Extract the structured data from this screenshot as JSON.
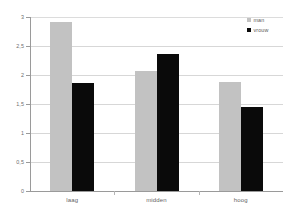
{
  "chart_data": {
    "type": "bar",
    "title": "",
    "subtitle": "",
    "xlabel": "",
    "ylabel": "",
    "categories": [
      "laag",
      "midden",
      "hoog"
    ],
    "series": [
      {
        "name": "man",
        "color": "#c2c2c2",
        "values": [
          2.91,
          2.07,
          1.88
        ]
      },
      {
        "name": "vrouw",
        "color": "#0a0a0a",
        "values": [
          1.86,
          2.36,
          1.45
        ]
      }
    ],
    "ylim": [
      0,
      3
    ],
    "ytick_values": [
      0,
      0.5,
      1,
      1.5,
      2,
      2.5,
      3
    ],
    "ytick_labels": [
      "0",
      "0,5",
      "1",
      "1,5",
      "2",
      "2,5",
      "3"
    ],
    "grid": true,
    "grid_axis": "y",
    "legend_position": "top-right",
    "annotations": []
  },
  "legend": {
    "entries": [
      {
        "label": "man",
        "swatch": "legend-swatch-man"
      },
      {
        "label": "vrouw",
        "swatch": "legend-swatch-vrouw"
      }
    ]
  },
  "colors": {
    "series_man": "#c2c2c2",
    "series_vrouw": "#0a0a0a",
    "gridline": "#d7d7d7",
    "axis": "#9a9a9a",
    "tick_text": "#6e6e6e",
    "background": "#ffffff"
  }
}
